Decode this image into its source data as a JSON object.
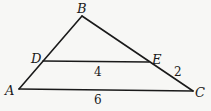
{
  "diagram": {
    "type": "triangle-with-parallel-segment",
    "vertices": {
      "A": {
        "label": "A",
        "x": 19,
        "y": 89
      },
      "B": {
        "label": "B",
        "x": 82,
        "y": 16
      },
      "C": {
        "label": "C",
        "x": 193,
        "y": 91
      },
      "D": {
        "label": "D",
        "x": 43,
        "y": 61
      },
      "E": {
        "label": "E",
        "x": 149,
        "y": 62
      }
    },
    "segments": [
      {
        "from": "A",
        "to": "B"
      },
      {
        "from": "B",
        "to": "C"
      },
      {
        "from": "A",
        "to": "C"
      },
      {
        "from": "D",
        "to": "E"
      }
    ],
    "measures": {
      "DE": "4",
      "AC": "6",
      "EC": "2"
    },
    "colors": {
      "stroke": "#1a1a1a",
      "background": "#f7f7f5"
    }
  }
}
